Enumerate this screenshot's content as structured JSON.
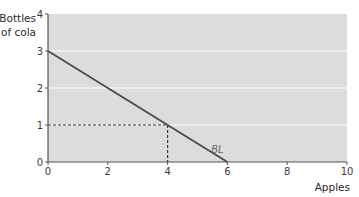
{
  "chart_data": {
    "type": "line",
    "title": "",
    "xlabel": "Apples",
    "ylabel": "Bottles of cola",
    "ylabel_lines": [
      "Bottles",
      "of cola"
    ],
    "xlim": [
      0,
      10
    ],
    "ylim": [
      0,
      4
    ],
    "x_ticks": [
      0,
      2,
      4,
      6,
      8,
      10
    ],
    "y_ticks": [
      0,
      1,
      2,
      3,
      4
    ],
    "grid": {
      "horizontal": true,
      "vertical": false,
      "values": [
        1,
        2,
        3
      ]
    },
    "series": [
      {
        "name": "BL",
        "label": "BL",
        "points": [
          [
            0,
            3
          ],
          [
            6,
            0
          ]
        ],
        "color": "#4a4a4a"
      }
    ],
    "annotations": [
      {
        "type": "dashed-guide",
        "point": [
          4,
          1
        ],
        "description": "Dashed lines from (4,1) to each axis"
      }
    ],
    "background_color": "#dcdcdc",
    "legend": "none"
  }
}
